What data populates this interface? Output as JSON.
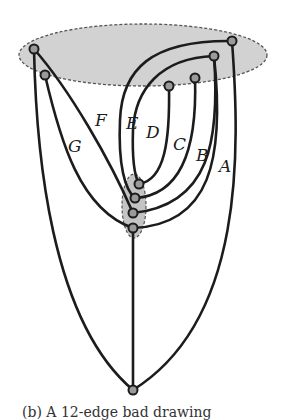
{
  "diagram": {
    "colors": {
      "region_fill": "#d2d2d2",
      "region_stroke": "#555555",
      "edge": "#1c1c1c",
      "node_fill": "#9a9a9a"
    },
    "regions": [
      {
        "id": "top-region",
        "shape": "ellipse",
        "cx": 143,
        "cy": 55,
        "rx": 124,
        "ry": 31,
        "style": "dashed"
      },
      {
        "id": "middle-region",
        "shape": "ellipse",
        "cx": 134,
        "cy": 206,
        "rx": 12,
        "ry": 32,
        "style": "dashed"
      }
    ],
    "nodes": [
      {
        "id": "t1",
        "x": 34,
        "y": 49
      },
      {
        "id": "t2",
        "x": 45,
        "y": 75
      },
      {
        "id": "t3",
        "x": 232,
        "y": 41
      },
      {
        "id": "t4",
        "x": 214,
        "y": 56
      },
      {
        "id": "t5",
        "x": 195,
        "y": 78
      },
      {
        "id": "t6",
        "x": 169,
        "y": 86
      },
      {
        "id": "m1",
        "x": 139,
        "y": 184
      },
      {
        "id": "m2",
        "x": 135,
        "y": 198
      },
      {
        "id": "m3",
        "x": 133,
        "y": 213
      },
      {
        "id": "m4",
        "x": 133,
        "y": 228
      },
      {
        "id": "b1",
        "x": 133,
        "y": 390
      }
    ],
    "edge_labels": [
      {
        "text": "A",
        "x": 219,
        "y": 166
      },
      {
        "text": "B",
        "x": 196,
        "y": 157
      },
      {
        "text": "C",
        "x": 173,
        "y": 146
      },
      {
        "text": "D",
        "x": 146,
        "y": 135
      },
      {
        "text": "E",
        "x": 126,
        "y": 125
      },
      {
        "text": "F",
        "x": 95,
        "y": 122
      },
      {
        "text": "G",
        "x": 69,
        "y": 148
      }
    ],
    "caption": "(b) A 12-edge bad drawing"
  }
}
